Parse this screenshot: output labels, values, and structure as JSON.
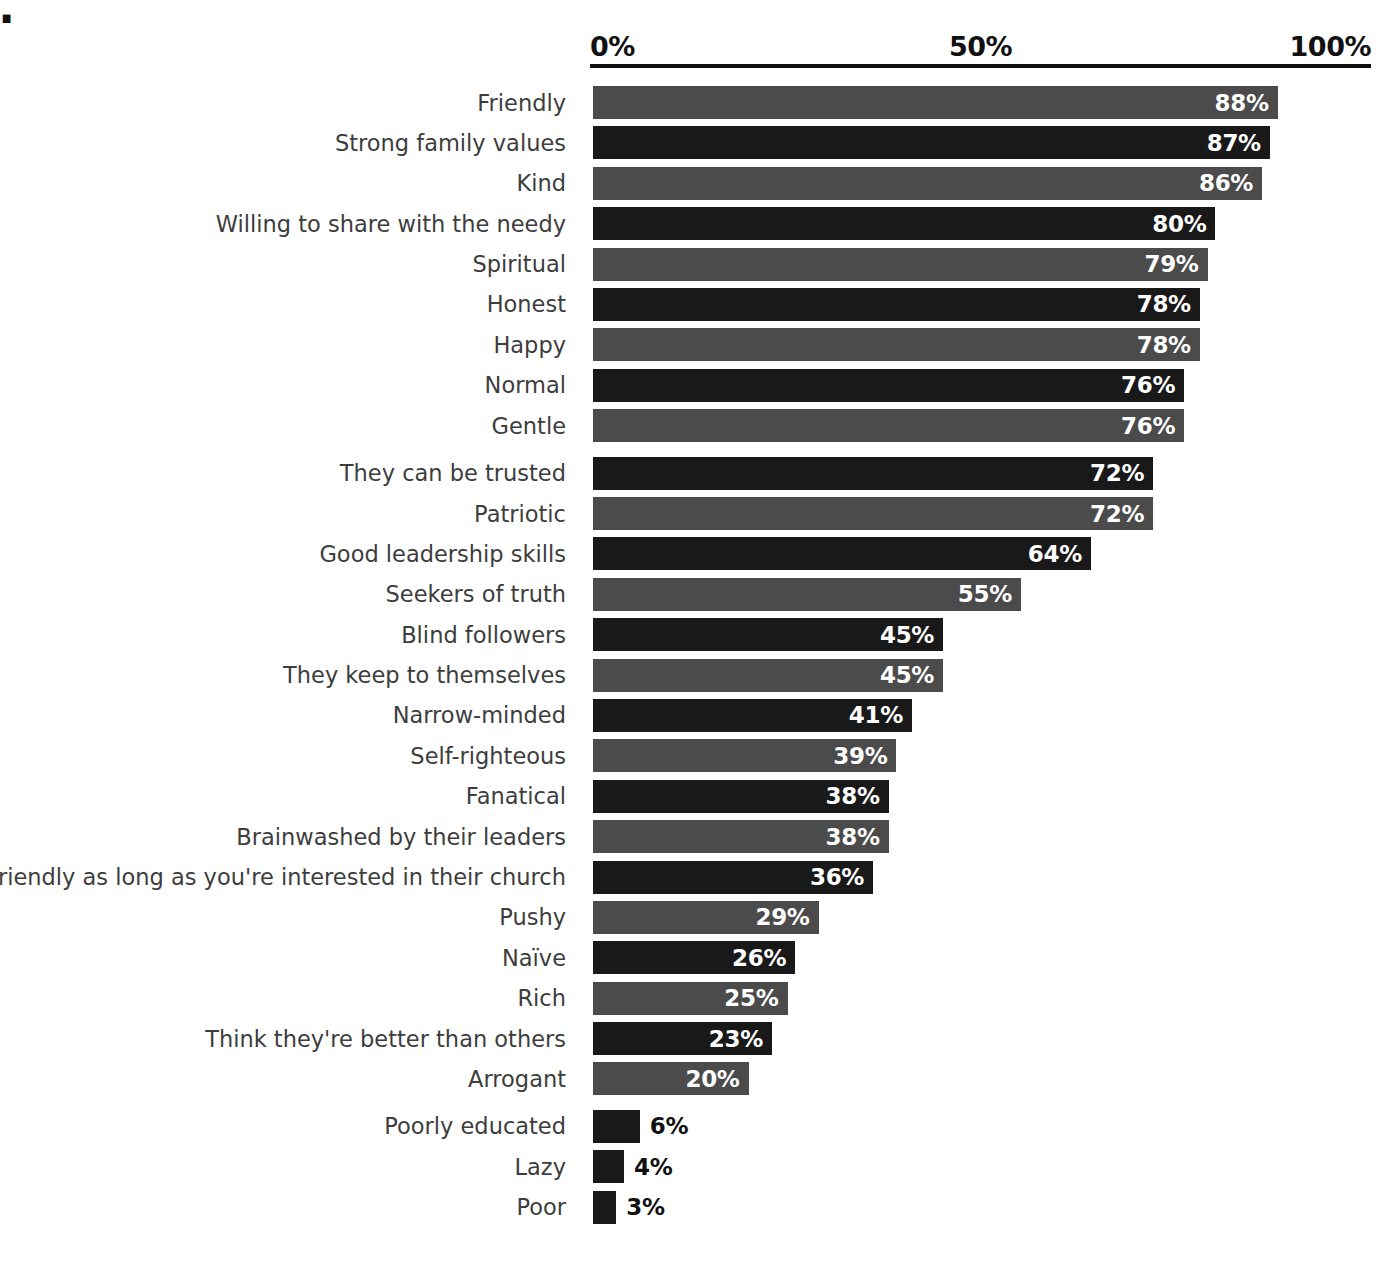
{
  "title_fragment": "nce.",
  "body_copy": {
    "lines": [
      "e positively",
      "rch as a",
      "easier to",
      "ations.  But",
      "sual for",
      "Mormon",
      "extending",
      "me through",
      "ptive words",
      "positive",
      "eneral",
      "t, and all",
      "ajority,",
      "he case",
      "urch we"
    ]
  },
  "chart_data": {
    "type": "bar",
    "orientation": "horizontal",
    "title": "",
    "xlabel": "",
    "ylabel": "",
    "xlim": [
      0,
      100
    ],
    "tick_labels": [
      "0%",
      "50%",
      "100%"
    ],
    "tick_values": [
      0,
      50,
      100
    ],
    "grid": false,
    "legend": null,
    "value_suffix": "%",
    "categories": [
      "Friendly",
      "Strong family values",
      "Kind",
      "Willing to share with the needy",
      "Spiritual",
      "Honest",
      "Happy",
      "Normal",
      "Gentle",
      "They can be trusted",
      "Patriotic",
      "Good leadership skills",
      "Seekers of truth",
      "Blind followers",
      "They keep to themselves",
      "Narrow-minded",
      "Self-righteous",
      "Fanatical",
      "Brainwashed by their leaders",
      "Friendly as long as you're interested in their church",
      "Pushy",
      "Naïve",
      "Rich",
      "Think they're better than others",
      "Arrogant",
      "Poorly educated",
      "Lazy",
      "Poor"
    ],
    "values": [
      88,
      87,
      86,
      80,
      79,
      78,
      78,
      76,
      76,
      72,
      72,
      64,
      55,
      45,
      45,
      41,
      39,
      38,
      38,
      36,
      29,
      26,
      25,
      23,
      20,
      6,
      4,
      3
    ],
    "value_labels": [
      "88%",
      "87%",
      "86%",
      "80%",
      "79%",
      "78%",
      "78%",
      "76%",
      "76%",
      "72%",
      "72%",
      "64%",
      "55%",
      "45%",
      "45%",
      "41%",
      "39%",
      "38%",
      "38%",
      "36%",
      "29%",
      "26%",
      "25%",
      "23%",
      "20%",
      "6%",
      "4%",
      "3%"
    ],
    "bar_shades": [
      "light",
      "dark",
      "light",
      "dark",
      "light",
      "dark",
      "light",
      "dark",
      "light",
      "dark",
      "light",
      "dark",
      "light",
      "dark",
      "light",
      "dark",
      "light",
      "dark",
      "light",
      "dark",
      "light",
      "dark",
      "light",
      "dark",
      "light",
      "dark",
      "dark",
      "dark"
    ],
    "label_placement": [
      "inside",
      "inside",
      "inside",
      "inside",
      "inside",
      "inside",
      "inside",
      "inside",
      "inside",
      "inside",
      "inside",
      "inside",
      "inside",
      "inside",
      "inside",
      "inside",
      "inside",
      "inside",
      "inside",
      "inside",
      "inside",
      "inside",
      "inside",
      "inside",
      "inside",
      "outside",
      "outside",
      "outside"
    ],
    "group_breaks_after": [
      8,
      24
    ]
  },
  "colors": {
    "bar_light": "#4b4b4b",
    "bar_dark": "#191919",
    "axis": "#111111",
    "label_text": "#3d3d3d",
    "value_inside": "#ffffff",
    "value_outside": "#111111",
    "background": "#ffffff"
  }
}
